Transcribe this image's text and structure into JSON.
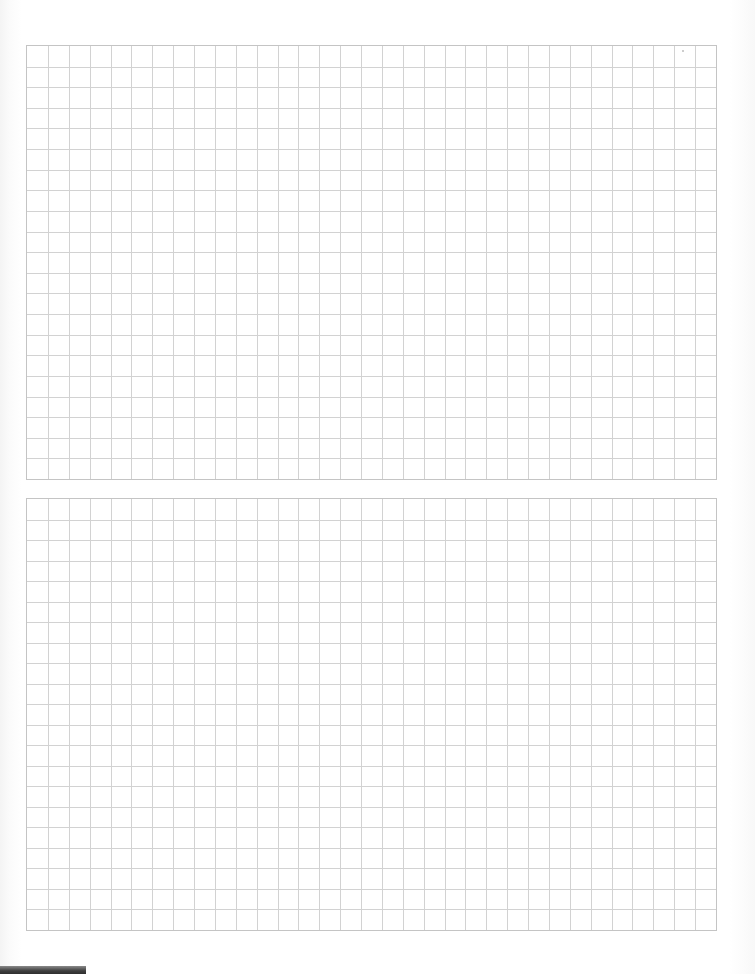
{
  "document": {
    "type": "graph-paper-page",
    "background_color": "#ffffff",
    "grid_line_color": "#d2d2d2",
    "grid_border_color": "#c4c4c4",
    "grids": [
      {
        "id": "grid-top",
        "left": 26,
        "top": 45,
        "width": 691,
        "height": 435,
        "columns": 33,
        "rows": 21
      },
      {
        "id": "grid-bottom",
        "left": 26,
        "top": 498,
        "width": 691,
        "height": 433,
        "columns": 33,
        "rows": 21
      }
    ],
    "footer_bar_color": "#333333"
  }
}
